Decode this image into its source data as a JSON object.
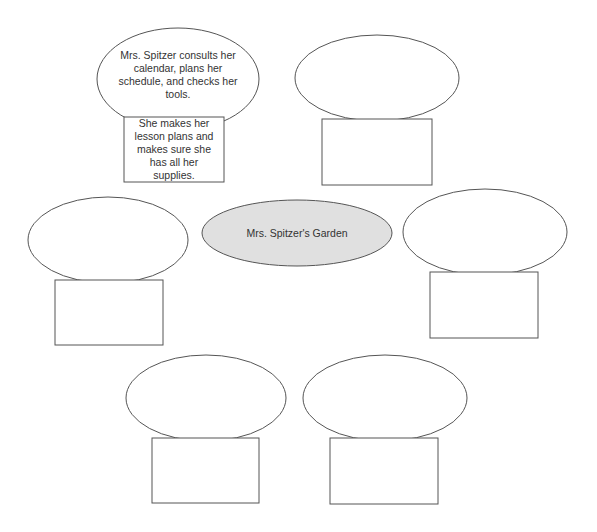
{
  "diagram": {
    "title": "Mrs. Spitzer's Garden",
    "center": {
      "label": "Mrs. Spitzer's Garden",
      "fill": "#e0e0e0",
      "stroke": "#555555"
    },
    "nodes": [
      {
        "id": "top-left",
        "oval_text": "Mrs. Spitzer consults her calendar, plans her schedule, and checks her tools.",
        "box_text": "She makes her lesson plans and makes sure she has all her supplies."
      },
      {
        "id": "top-right",
        "oval_text": "",
        "box_text": ""
      },
      {
        "id": "middle-left",
        "oval_text": "",
        "box_text": ""
      },
      {
        "id": "middle-right",
        "oval_text": "",
        "box_text": ""
      },
      {
        "id": "bottom-left",
        "oval_text": "",
        "box_text": ""
      },
      {
        "id": "bottom-right",
        "oval_text": "",
        "box_text": ""
      }
    ],
    "stroke_color": "#555555"
  }
}
